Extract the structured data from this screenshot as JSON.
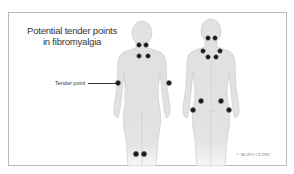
{
  "title_line1": "Potential tender points",
  "title_line2": "in fibromyalgia",
  "callout_label": "Tender point",
  "copyright": "© MAYO CLINIC",
  "colors": {
    "body": "#e2e2e2",
    "body_outline": "#c4c4c4",
    "tender_point": "#1a1a1a",
    "frame": "#b9b9b9",
    "text": "#333333"
  },
  "figures": [
    {
      "view": "front",
      "tender_points": [
        "neck-left",
        "neck-right",
        "chest-left",
        "chest-right",
        "elbow-left",
        "elbow-right",
        "knee-left",
        "knee-right"
      ]
    },
    {
      "view": "back",
      "tender_points": [
        "neck-left",
        "neck-right",
        "shoulder-left",
        "shoulder-right",
        "upper-back-left",
        "upper-back-right",
        "hip-left",
        "hip-right",
        "buttock-left",
        "buttock-right"
      ]
    }
  ]
}
